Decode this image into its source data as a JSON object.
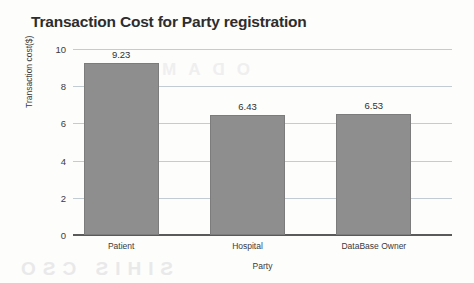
{
  "chart_data": {
    "type": "bar",
    "title": "Transaction Cost for Party registration",
    "xlabel": "Party",
    "ylabel": "Transaction cost($)",
    "categories": [
      "Patient",
      "Hospital",
      "DataBase Owner"
    ],
    "values": [
      9.23,
      6.43,
      6.53
    ],
    "value_labels": [
      "9.23",
      "6.43",
      "6.53"
    ],
    "ylim": [
      0,
      10
    ],
    "yticks": [
      0,
      2,
      4,
      6,
      8,
      10
    ],
    "ytick_labels": [
      "0",
      "2",
      "4",
      "6",
      "8",
      "10"
    ],
    "grid": true,
    "legend": false,
    "series": [
      {
        "name": "Transaction cost($)",
        "values": [
          9.23,
          6.43,
          6.53
        ],
        "color": "#8e8e8e"
      }
    ],
    "colors": {
      "bar_fill": "#8e8e8e",
      "bar_border": "#7c7c7c",
      "gridline": "#c3cbd4",
      "axis": "#5a5a5a",
      "title_text": "#2d2d2d",
      "background": "#fdfdfc"
    }
  },
  "artifacts": {
    "bleed_mid": "ODAM",
    "bleed_bottom": "SIHIS CSO"
  }
}
